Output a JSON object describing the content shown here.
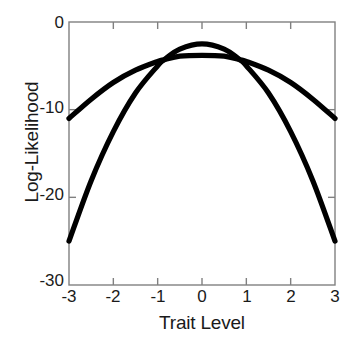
{
  "chart_data": {
    "type": "line",
    "title": "",
    "xlabel": "Trait Level",
    "ylabel": "Log-Likelihood",
    "xlim": [
      -3,
      3
    ],
    "ylim": [
      -30,
      0
    ],
    "xticks": [
      "-3",
      "-2",
      "-1",
      "0",
      "1",
      "2",
      "3"
    ],
    "xtick_values": [
      -3,
      -2,
      -1,
      0,
      1,
      2,
      3
    ],
    "yticks": [
      "0",
      "-10",
      "-20",
      "-30"
    ],
    "ytick_values": [
      0,
      -10,
      -20,
      -30
    ],
    "grid": false,
    "legend": "none",
    "line_color": "#000000",
    "axis_color": "#808080",
    "x": [
      -3,
      -2.5,
      -2,
      -1.5,
      -1,
      -0.85,
      -0.5,
      0,
      0.5,
      0.85,
      1,
      1.5,
      2,
      2.5,
      3
    ],
    "series": [
      {
        "name": "Flat log-likelihood (wide, low peak)",
        "values": [
          -11.0,
          -8.8,
          -6.9,
          -5.5,
          -4.5,
          -4.3,
          -3.9,
          -3.8,
          -3.9,
          -4.3,
          -4.5,
          -5.5,
          -6.9,
          -8.8,
          -11.0
        ],
        "peak_x": 0,
        "peak_y": -3.8
      },
      {
        "name": "Peaked log-likelihood (narrow, high peak)",
        "values": [
          -25.0,
          -18.1,
          -12.5,
          -8.1,
          -5.0,
          -4.3,
          -3.1,
          -2.5,
          -3.1,
          -4.3,
          -5.0,
          -8.1,
          -12.5,
          -18.1,
          -25.0
        ],
        "peak_x": 0,
        "peak_y": -2.5
      }
    ],
    "annotations": {
      "crossings_x": [
        -0.85,
        0.85
      ],
      "crossings_y": -4.3
    }
  },
  "axis_labels": {
    "y": "Log-Likelihood",
    "x": "Trait Level"
  }
}
